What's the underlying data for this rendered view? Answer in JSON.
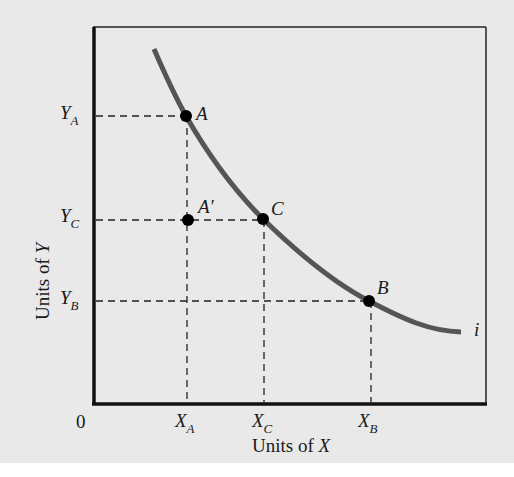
{
  "diagram": {
    "type": "indifference-curve",
    "axes": {
      "x_label_prefix": "Units of ",
      "x_label_var": "X",
      "y_label_prefix": "Units of ",
      "y_label_var": "Y",
      "origin": "0"
    },
    "curve": {
      "label": "i",
      "color": "#555555"
    },
    "points": [
      {
        "id": "A",
        "label": "A"
      },
      {
        "id": "A_prime",
        "label": "A",
        "prime": "′"
      },
      {
        "id": "C",
        "label": "C"
      },
      {
        "id": "B",
        "label": "B"
      }
    ],
    "x_ticks": [
      {
        "base": "X",
        "sub": "A"
      },
      {
        "base": "X",
        "sub": "C"
      },
      {
        "base": "X",
        "sub": "B"
      }
    ],
    "y_ticks": [
      {
        "base": "Y",
        "sub": "A"
      },
      {
        "base": "Y",
        "sub": "C"
      },
      {
        "base": "Y",
        "sub": "B"
      }
    ],
    "colors": {
      "background": "#e9e9e9",
      "axis": "#111111",
      "curve": "#555555",
      "point": "#000000"
    }
  }
}
